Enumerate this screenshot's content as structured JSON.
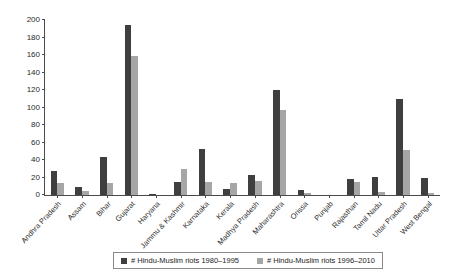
{
  "chart_data": {
    "type": "bar",
    "title": "",
    "xlabel": "",
    "ylabel": "",
    "ylim": [
      0,
      200
    ],
    "ytick_step": 20,
    "yticks": [
      0,
      20,
      40,
      60,
      80,
      100,
      120,
      140,
      160,
      180,
      200
    ],
    "grid": false,
    "legend_position": "bottom",
    "categories": [
      "Andhra Pradesh",
      "Assam",
      "Bihar",
      "Gujarat",
      "Haryana",
      "Jammu & Kashmir",
      "Karnataka",
      "Kerala",
      "Madhya Pradesh",
      "Maharashtra",
      "Orissa",
      "Punjab",
      "Rajasthan",
      "Tamil Nadu",
      "Uttar Pradesh",
      "West Bengal"
    ],
    "series": [
      {
        "name": "# Hindu-Muslim riots 1980–1995",
        "color": "#3f3f3f",
        "values": [
          28,
          9,
          43,
          194,
          1,
          15,
          53,
          7,
          23,
          120,
          6,
          0,
          18,
          21,
          110,
          20
        ]
      },
      {
        "name": "# Hindu-Muslim riots 1996–2010",
        "color": "#a6a6a6",
        "values": [
          14,
          5,
          14,
          159,
          0,
          30,
          15,
          14,
          16,
          97,
          2,
          0,
          15,
          3,
          52,
          2
        ]
      }
    ]
  },
  "legend": {
    "items": [
      {
        "label": "# Hindu-Muslim riots 1980–1995",
        "swatch": "dark-swatch"
      },
      {
        "label": "# Hindu-Muslim riots 1996–2010",
        "swatch": "light-swatch"
      }
    ]
  },
  "colors": {
    "series_1980_1995": "#3f3f3f",
    "series_1996_2010": "#a6a6a6",
    "axis": "#4a4a4a",
    "background": "#ffffff"
  }
}
